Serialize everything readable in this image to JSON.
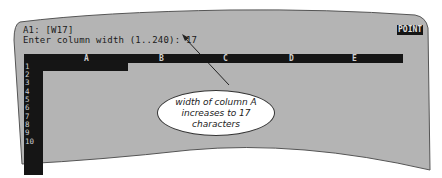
{
  "status_line": {
    "cell_address": "A1: [W17]",
    "mode_indicator": "POINT"
  },
  "prompt_line": {
    "text": "Enter column width (1..240): 17"
  },
  "worksheet": {
    "columns": [
      "A",
      "B",
      "C",
      "D",
      "E"
    ],
    "rows": [
      "1",
      "2",
      "3",
      "4",
      "5",
      "6",
      "7",
      "8",
      "9",
      "10"
    ],
    "selected_cell": "A1"
  },
  "callout": {
    "lines": [
      "width of column A",
      "increases to 17",
      "characters"
    ]
  },
  "colors": {
    "screen_bg": "#b4b4b4",
    "header_bar": "#151515",
    "header_text": "#cfcfcf",
    "callout_bg": "#ffffff"
  }
}
